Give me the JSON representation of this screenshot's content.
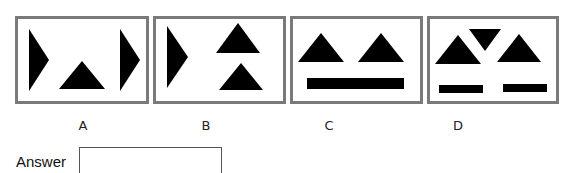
{
  "options": [
    {
      "label": "A",
      "shapes": [
        "right-pointing-triangle-left",
        "upward-triangle-bottom-center",
        "right-pointing-triangle-right"
      ]
    },
    {
      "label": "B",
      "shapes": [
        "right-pointing-triangle-left",
        "upward-triangle-top-right",
        "upward-triangle-bottom-right"
      ]
    },
    {
      "label": "C",
      "shapes": [
        "upward-triangle-left",
        "upward-triangle-right",
        "horizontal-bar-bottom"
      ]
    },
    {
      "label": "D",
      "shapes": [
        "upward-triangle-left",
        "downward-triangle-top-center",
        "upward-triangle-right",
        "short-bar-bottom-left",
        "short-bar-bottom-right"
      ]
    }
  ],
  "answer": {
    "label": "Answer",
    "value": ""
  },
  "colors": {
    "shape_fill": "#000000",
    "box_border": "#7a7a7a"
  }
}
